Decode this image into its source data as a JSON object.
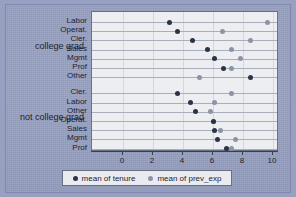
{
  "chart_data": {
    "type": "scatter",
    "title": "",
    "xlabel": "",
    "ylabel": "",
    "xlim": [
      0,
      10
    ],
    "xticks": [
      0,
      2,
      4,
      6,
      8,
      10
    ],
    "xtick_labels": [
      "0",
      "2",
      "4",
      "6",
      "8",
      "10"
    ],
    "grid": true,
    "legend_position": "bottom",
    "legend": [
      {
        "name": "mean of tenure",
        "color": "#2b3347",
        "marker": "circle"
      },
      {
        "name": "mean of prev_exp",
        "color": "#8d93a6",
        "marker": "circle"
      }
    ],
    "series": [
      {
        "name": "mean of tenure",
        "key": "tenure",
        "color": "#2b3347"
      },
      {
        "name": "mean of prev_exp",
        "key": "prev_exp",
        "color": "#8d93a6"
      }
    ],
    "groups": [
      {
        "label": "college grad",
        "rows": [
          {
            "category": "Labor",
            "tenure": 3.1,
            "prev_exp": 9.6
          },
          {
            "category": "Operat.",
            "tenure": 3.6,
            "prev_exp": 6.6
          },
          {
            "category": "Cler.",
            "tenure": 4.6,
            "prev_exp": 8.5
          },
          {
            "category": "Sales",
            "tenure": 5.6,
            "prev_exp": 7.2
          },
          {
            "category": "Mgmt",
            "tenure": 6.1,
            "prev_exp": 7.8
          },
          {
            "category": "Prof",
            "tenure": 6.7,
            "prev_exp": 7.2
          },
          {
            "category": "Other",
            "tenure": 8.5,
            "prev_exp": 5.1
          }
        ]
      },
      {
        "label": "not college grad",
        "rows": [
          {
            "category": "Cler.",
            "tenure": 3.6,
            "prev_exp": 7.2
          },
          {
            "category": "Labor",
            "tenure": 4.5,
            "prev_exp": 6.1
          },
          {
            "category": "Other",
            "tenure": 4.8,
            "prev_exp": 5.8
          },
          {
            "category": "Operat.",
            "tenure": 6.0,
            "prev_exp": 6.0
          },
          {
            "category": "Sales",
            "tenure": 6.1,
            "prev_exp": 6.5
          },
          {
            "category": "Mgmt",
            "tenure": 6.3,
            "prev_exp": 7.5
          },
          {
            "category": "Prof",
            "tenure": 6.9,
            "prev_exp": 7.2
          }
        ]
      }
    ]
  },
  "colors": {
    "background": "#97a0c0",
    "plot_background": "#eceef2",
    "tenure": "#2b3347",
    "prev_exp": "#8d93a6",
    "axis": "#3a3f4d",
    "gridline": "#a9aebb"
  }
}
